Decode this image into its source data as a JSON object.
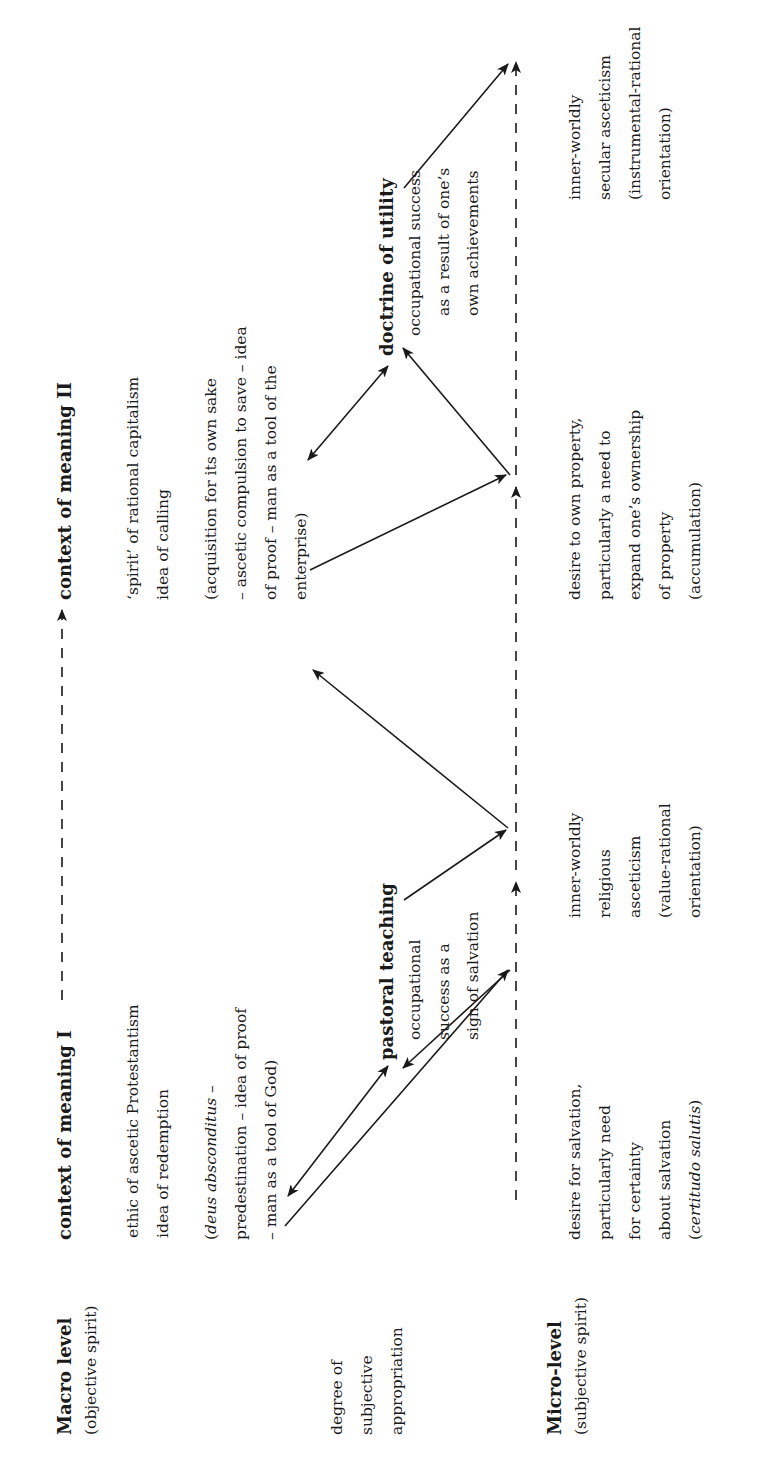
{
  "orientation": "rotated -90deg (text reads bottom-to-top)",
  "levels": {
    "macro": {
      "title": "Macro level",
      "subtitle": "(objective spirit)"
    },
    "middle": {
      "lines": [
        "degree of",
        "subjective",
        "appropriation"
      ]
    },
    "micro": {
      "title": "Micro-level",
      "subtitle": "(subjective spirit)"
    }
  },
  "context_I": {
    "title": "context of meaning I",
    "lines": [
      "ethic of ascetic Protestantism",
      "idea of redemption"
    ],
    "detail_italic_lead": "deus absconditus",
    "detail_lines": [
      "(deus absconditus –",
      "predestination – idea of proof",
      "– man as a tool of God)"
    ]
  },
  "context_II": {
    "title": "context of meaning II",
    "lines": [
      "‘spirit’ of rational capitalism",
      "idea of calling"
    ],
    "detail_lines": [
      "(acquisition for its own sake",
      "– ascetic compulsion to save – idea",
      "of proof – man as a tool of the",
      "enterprise)"
    ]
  },
  "pastoral": {
    "title": "pastoral teaching",
    "lines": [
      "occupational",
      "success as a",
      "sign of salvation"
    ]
  },
  "utility": {
    "title": "doctrine of utility",
    "lines": [
      "occupational success",
      "as a result of one’s",
      "own achievements"
    ]
  },
  "micro_items": [
    {
      "lines": [
        "desire for salvation,",
        "particularly need",
        "for certainty",
        "about salvation",
        "(certitudo salutis)"
      ],
      "italic_last": "certitudo salutis"
    },
    {
      "lines": [
        "inner-worldly",
        "religious",
        "asceticism",
        "(value-rational",
        "orientation)"
      ]
    },
    {
      "lines": [
        "desire to own property,",
        "particularly a need to",
        "expand one’s ownership",
        "of property",
        "(accumulation)"
      ]
    },
    {
      "lines": [
        "inner-worldly",
        "secular asceticism",
        "(instrumental-rational",
        "orientation)"
      ]
    }
  ],
  "colors": {
    "ink": "#1a1a1a",
    "background": "#ffffff"
  }
}
